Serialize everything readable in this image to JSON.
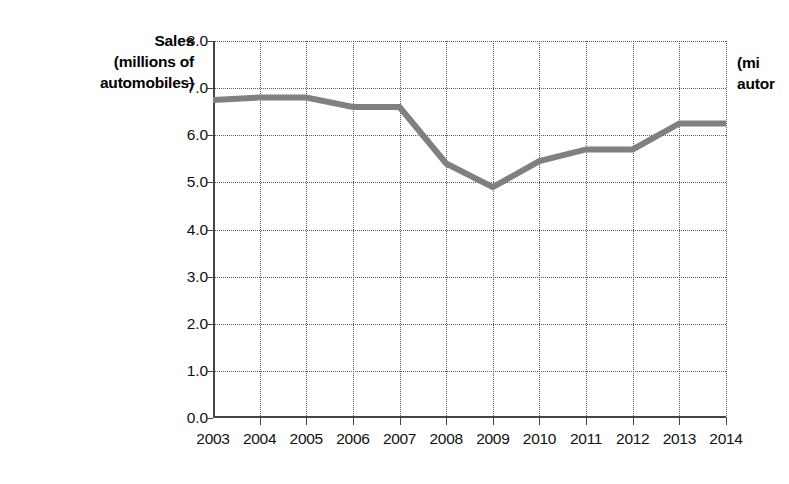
{
  "chart_data": {
    "type": "line",
    "title": "",
    "ylabel": "Sales (millions of automobiles)",
    "ylabel_lines": [
      "Sales",
      "(millions of",
      "automobiles)"
    ],
    "xlabel": "",
    "categories": [
      "2003",
      "2004",
      "2005",
      "2006",
      "2007",
      "2008",
      "2009",
      "2010",
      "2011",
      "2012",
      "2013",
      "2014"
    ],
    "values": [
      6.75,
      6.8,
      6.8,
      6.6,
      6.6,
      5.4,
      4.9,
      5.45,
      5.7,
      5.7,
      6.25,
      6.25
    ],
    "x": [
      2003,
      2004,
      2005,
      2006,
      2007,
      2008,
      2009,
      2010,
      2011,
      2012,
      2013,
      2014
    ],
    "ylim": [
      0.0,
      8.0
    ],
    "ytick_labels": [
      "0.0",
      "1.0",
      "2.0",
      "3.0",
      "4.0",
      "5.0",
      "6.0",
      "7.0",
      "8.0"
    ],
    "ytick_values": [
      0.0,
      1.0,
      2.0,
      3.0,
      4.0,
      5.0,
      6.0,
      7.0,
      8.0
    ],
    "grid": true,
    "grid_style": "dotted",
    "legend": false,
    "legend_position": "none",
    "series": [
      {
        "name": "Sales",
        "color": "#808080",
        "values": [
          6.75,
          6.8,
          6.8,
          6.6,
          6.6,
          5.4,
          4.9,
          5.45,
          5.7,
          5.7,
          6.25,
          6.25
        ]
      }
    ]
  },
  "colors": {
    "line": "#808080",
    "axis": "#444444",
    "grid": "#5a5a5a",
    "text": "#111111",
    "background": "#ffffff"
  },
  "neighbor_chart": {
    "label_lines": [
      "(mi",
      "autor"
    ]
  }
}
